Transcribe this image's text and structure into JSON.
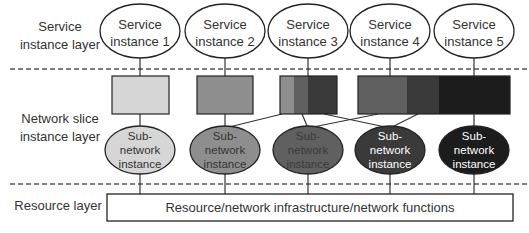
{
  "layers": {
    "service": [
      "Service",
      "instance layer"
    ],
    "slice": [
      "Network slice",
      "instance layer"
    ],
    "resource": "Resource layer"
  },
  "service_instances": [
    {
      "line1": "Service",
      "line2": "instance 1"
    },
    {
      "line1": "Service",
      "line2": "instance 2"
    },
    {
      "line1": "Service",
      "line2": "instance 3"
    },
    {
      "line1": "Service",
      "line2": "instance 4"
    },
    {
      "line1": "Service",
      "line2": "instance 5"
    }
  ],
  "slice_segment_colors": [
    "#d6d6d6",
    "#8e8e8e",
    "#606060",
    "#3a3a3a",
    "#1c1c1c"
  ],
  "network_slices": [
    {
      "name": "slice-1",
      "segments": [
        1
      ],
      "serves": 1
    },
    {
      "name": "slice-2",
      "segments": [
        2
      ],
      "serves": 2
    },
    {
      "name": "slice-3",
      "segments": [
        2,
        3,
        4
      ],
      "serves": 3
    },
    {
      "name": "slice-4-5",
      "segments": [
        3,
        4,
        5
      ],
      "serves": [
        4,
        5
      ]
    }
  ],
  "subnetwork_instances": [
    {
      "lines": [
        "Sub-",
        "network",
        "instance"
      ],
      "fill": "#d6d6d6",
      "text_color": "#333333"
    },
    {
      "lines": [
        "Sub-",
        "network",
        "instance"
      ],
      "fill": "#8e8e8e",
      "text_color": "#333333"
    },
    {
      "lines": [
        "Sub-",
        "network",
        "instance"
      ],
      "fill": "#606060",
      "text_color": "#3a3a3a"
    },
    {
      "lines": [
        "Sub-",
        "network",
        "instance"
      ],
      "fill": "#3a3a3a",
      "text_color": "#ffffff"
    },
    {
      "lines": [
        "Sub-",
        "network",
        "instance"
      ],
      "fill": "#1c1c1c",
      "text_color": "#ffffff"
    }
  ],
  "resource_box": {
    "label": "Resource/network infrastructure/network functions"
  }
}
